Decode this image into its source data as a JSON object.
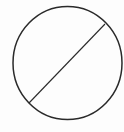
{
  "figure": {
    "type": "geometry-diagram",
    "description": "Circle with a chord (diameter-like line) from lower-left to upper-right",
    "background": "#fdfdfd",
    "circle": {
      "cx": 67.5,
      "cy": 63,
      "rx": 54.5,
      "ry": 56.5,
      "stroke": "#2a2a2a",
      "stroke_width": 1.5
    },
    "chord": {
      "x1": 29,
      "y1": 103,
      "x2": 105,
      "y2": 24,
      "stroke": "#2a2a2a",
      "stroke_width": 1.1
    }
  }
}
